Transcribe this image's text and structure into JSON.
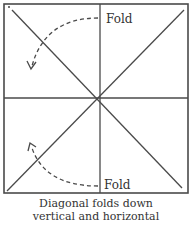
{
  "diagram": {
    "labels": {
      "fold_top": "Fold",
      "fold_bottom": "Fold"
    },
    "caption": {
      "line1": "Diagonal folds down",
      "line2": "vertical and horizontal"
    },
    "colors": {
      "line": "#4a4a4a",
      "text": "#333333",
      "background": "#ffffff"
    }
  }
}
